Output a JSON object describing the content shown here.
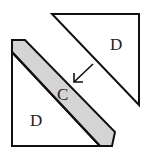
{
  "diagram": {
    "pieces": [
      {
        "id": "top-triangle",
        "label": "D",
        "fill": "#ffffff"
      },
      {
        "id": "strip",
        "label": "C",
        "fill": "#d4d4d4"
      },
      {
        "id": "bottom-triangle",
        "label": "D",
        "fill": "#ffffff"
      }
    ],
    "stroke_color": "#111111",
    "arrow": {
      "direction": "down-left",
      "points_to": "C"
    }
  }
}
